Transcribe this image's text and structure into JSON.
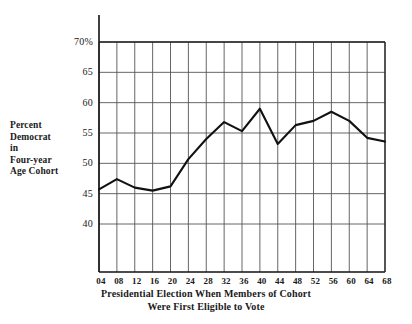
{
  "chart_data": {
    "type": "line",
    "title": "",
    "xlabel": "Presidential Election When Members of Cohort Were First Eligible to Vote",
    "xlabel_line1": "Presidential Election When Members of Cohort",
    "xlabel_line2": "Were First Eligible to Vote",
    "ylabel": "Percent Democrat in Four-year Age Cohort",
    "ylabel_lines": [
      "Percent",
      "Democrat",
      "in",
      "Four-year",
      "Age Cohort"
    ],
    "categories": [
      "04",
      "08",
      "12",
      "16",
      "20",
      "24",
      "28",
      "32",
      "36",
      "40",
      "44",
      "48",
      "52",
      "56",
      "60",
      "64",
      "68"
    ],
    "values": [
      45.7,
      47.4,
      46.0,
      45.5,
      46.2,
      50.7,
      54.0,
      56.8,
      55.3,
      59.0,
      53.2,
      56.3,
      57.0,
      58.5,
      57.0,
      54.2,
      53.6
    ],
    "ylim": [
      36.5,
      72.0
    ],
    "yticks": [
      70,
      65,
      60,
      55,
      50,
      45,
      40
    ],
    "ytick_labels": [
      "70%",
      "65",
      "60",
      "55",
      "50",
      "45",
      "40"
    ],
    "xticks": [
      "04",
      "08",
      "12",
      "16",
      "20",
      "24",
      "28",
      "32",
      "36",
      "40",
      "44",
      "48",
      "52",
      "56",
      "60",
      "64",
      "68"
    ],
    "grid": true,
    "legend": "none",
    "line_color": "#111111",
    "grid_color": "#555555"
  }
}
